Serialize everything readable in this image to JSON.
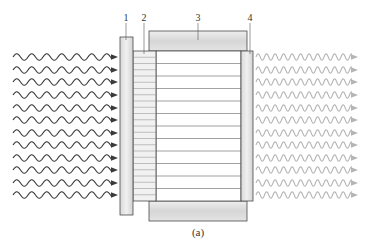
{
  "figure": {
    "caption": "(a)",
    "labels": [
      {
        "id": "1",
        "text": "1",
        "x": 126,
        "y": 21,
        "lead_to_y": 40
      },
      {
        "id": "2",
        "text": "2",
        "x": 144,
        "y": 21,
        "lead_to_y": 54
      },
      {
        "id": "3",
        "text": "3",
        "x": 198,
        "y": 21,
        "lead_to_y": 40
      },
      {
        "id": "4",
        "text": "4",
        "x": 250,
        "y": 21,
        "lead_to_y": 54
      }
    ],
    "components": {
      "plate_1": {
        "x": 120,
        "y": 37,
        "w": 13,
        "h": 178
      },
      "hatched_block_2": {
        "x": 133,
        "y": 51,
        "w": 23,
        "h": 150,
        "hatch_lines": 24
      },
      "main_body": {
        "x": 156,
        "y": 51,
        "w": 85,
        "h": 150,
        "divider_lines": 11
      },
      "top_bar_3": {
        "x": 149,
        "y": 31,
        "w": 98,
        "h": 20
      },
      "bottom_bar": {
        "x": 149,
        "y": 201,
        "w": 98,
        "h": 20
      },
      "plate_4": {
        "x": 241,
        "y": 51,
        "w": 12,
        "h": 150
      }
    },
    "incoming_waves": {
      "count": 12,
      "color": "#3a3a3a",
      "x_start": 13,
      "x_end": 118,
      "wavelength": 15,
      "amplitude": 3.2
    },
    "outgoing_waves": {
      "count": 12,
      "color": "#b4b4b4",
      "x_start": 256,
      "x_end": 358,
      "wavelength": 8.5,
      "amplitude": 3.2
    },
    "wave_rows_y": [
      57,
      70,
      82,
      95,
      108,
      120,
      133,
      145,
      158,
      170,
      183,
      195
    ],
    "colors": {
      "outline": "#4a4a4a",
      "plate_fill": "#e2e2e2",
      "bar_fill": "#dedede",
      "hatch": "#8a8a8a",
      "body_lines": "#7a7a7a"
    }
  }
}
